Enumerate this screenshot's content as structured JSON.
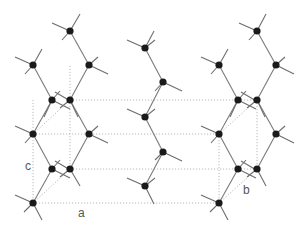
{
  "diagram": {
    "type": "crystal-structure",
    "colors": {
      "atom": "#1a1a1a",
      "bond": "#7a7a7a",
      "unit_cell": "#b8b8b8"
    },
    "labels": {
      "a": "a",
      "b": "b",
      "c": "c"
    },
    "unit_cell": {
      "front": [
        [
          33,
          134
        ],
        [
          219,
          134
        ],
        [
          219,
          203
        ],
        [
          33,
          203
        ]
      ],
      "back": [
        [
          70,
          100
        ],
        [
          257,
          100
        ],
        [
          257,
          169
        ],
        [
          70,
          169
        ]
      ]
    },
    "atoms": [
      [
        70,
        31
      ],
      [
        33,
        65
      ],
      [
        89,
        65
      ],
      [
        52,
        100
      ],
      [
        70,
        100
      ],
      [
        33,
        134
      ],
      [
        89,
        134
      ],
      [
        52,
        169
      ],
      [
        70,
        169
      ],
      [
        33,
        203
      ],
      [
        145,
        48
      ],
      [
        163,
        82
      ],
      [
        145,
        117
      ],
      [
        163,
        152
      ],
      [
        145,
        186
      ],
      [
        257,
        31
      ],
      [
        219,
        65
      ],
      [
        276,
        65
      ],
      [
        238,
        100
      ],
      [
        257,
        100
      ],
      [
        219,
        134
      ],
      [
        276,
        134
      ],
      [
        238,
        169
      ],
      [
        257,
        169
      ],
      [
        219,
        203
      ]
    ],
    "bonds": [
      [
        [
          70,
          31
        ],
        [
          89,
          65
        ]
      ],
      [
        [
          89,
          65
        ],
        [
          70,
          100
        ]
      ],
      [
        [
          33,
          65
        ],
        [
          52,
          100
        ]
      ],
      [
        [
          52,
          100
        ],
        [
          33,
          134
        ]
      ],
      [
        [
          70,
          100
        ],
        [
          89,
          134
        ]
      ],
      [
        [
          89,
          134
        ],
        [
          70,
          169
        ]
      ],
      [
        [
          33,
          134
        ],
        [
          52,
          169
        ]
      ],
      [
        [
          52,
          169
        ],
        [
          33,
          203
        ]
      ],
      [
        [
          145,
          48
        ],
        [
          163,
          82
        ]
      ],
      [
        [
          163,
          82
        ],
        [
          145,
          117
        ]
      ],
      [
        [
          145,
          117
        ],
        [
          163,
          152
        ]
      ],
      [
        [
          163,
          152
        ],
        [
          145,
          186
        ]
      ],
      [
        [
          257,
          31
        ],
        [
          276,
          65
        ]
      ],
      [
        [
          276,
          65
        ],
        [
          257,
          100
        ]
      ],
      [
        [
          219,
          65
        ],
        [
          238,
          100
        ]
      ],
      [
        [
          238,
          100
        ],
        [
          219,
          134
        ]
      ],
      [
        [
          257,
          100
        ],
        [
          276,
          134
        ]
      ],
      [
        [
          276,
          134
        ],
        [
          257,
          169
        ]
      ],
      [
        [
          219,
          134
        ],
        [
          238,
          169
        ]
      ],
      [
        [
          238,
          169
        ],
        [
          219,
          203
        ]
      ]
    ]
  }
}
